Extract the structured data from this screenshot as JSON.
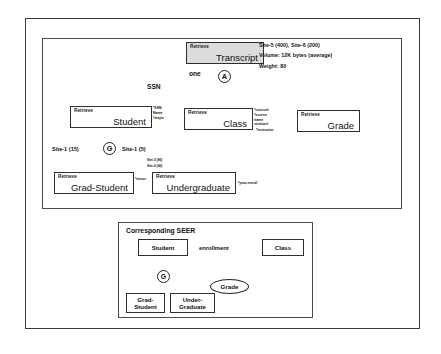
{
  "figure": {
    "top_panel": {
      "root": {
        "operation": "Retrieve",
        "entity": "Transcript"
      },
      "annotations": {
        "sites": "Site-5 (400), Site-6 (200)",
        "volume": "Volume: 12K bytes (average)",
        "weight": "Weight: 80"
      },
      "aggregation_node": "A",
      "link_labels": {
        "cardinality": "one",
        "key": "SSN"
      },
      "children": [
        {
          "operation": "Retrieve",
          "entity": "Student",
          "attributes": [
            "*SSN",
            "Name",
            "*major"
          ]
        },
        {
          "operation": "Retrieve",
          "entity": "Class",
          "attributes": [
            "*course#",
            "*course",
            "name",
            "section#",
            "*instructor"
          ]
        },
        {
          "operation": "Retrieve",
          "entity": "Grade",
          "attributes": []
        }
      ],
      "generalization_node": "G",
      "generalization_labels": {
        "left": "Site-1 (15)",
        "right": "Site-1 (5)",
        "right_sub_1": "Site-5 (80)",
        "right_sub_2": "Site-6 (40)"
      },
      "subtypes": [
        {
          "operation": "Retrieve",
          "entity": "Grad-Student",
          "attribute": "*minor"
        },
        {
          "operation": "Retrieve",
          "entity": "Undergraduate",
          "attribute": "*year-enroll"
        }
      ]
    },
    "seer_panel": {
      "title": "Corresponding SEER",
      "entities": {
        "student": "Student",
        "class": "Class",
        "grade": "Grade",
        "grad_student_line1": "Grad-",
        "grad_student_line2": "Student",
        "undergraduate_line1": "Under-",
        "undergraduate_line2": "Graduate"
      },
      "relationship": "enrollment",
      "generalization_node": "G"
    }
  },
  "colors": {
    "line": "#2e2e2e",
    "shaded_fill": "#dcdcdc",
    "background": "#ffffff",
    "diamond_fill": "#000000"
  }
}
